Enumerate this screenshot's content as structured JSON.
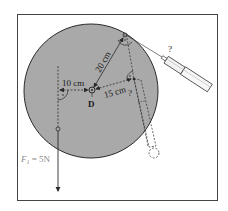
{
  "diagram": {
    "pivot_label": "D",
    "dimensions": [
      {
        "id": "dim-10",
        "label": "10 cm"
      },
      {
        "id": "dim-20",
        "label": "20 cm"
      },
      {
        "id": "dim-15",
        "label": "15 cm"
      }
    ],
    "force_f1": {
      "label": "F",
      "subscript": "1",
      "value_text": " = 5N"
    },
    "unknown_markers": [
      "?",
      "?"
    ],
    "colors": {
      "disc_fill": "#a9a9a9",
      "line": "#2a2a2a",
      "frame": "#444444",
      "background": "#ffffff"
    }
  }
}
